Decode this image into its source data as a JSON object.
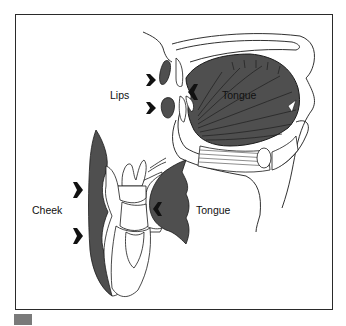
{
  "figure": {
    "labels": {
      "lips": "Lips",
      "tongue_sagittal": "Tongue",
      "cheek": "Cheek",
      "tongue_coronal": "Tongue"
    },
    "colors": {
      "muscle_fill": "#4f4f4f",
      "outline": "#1a1a1a",
      "frame": "#2a2a2a",
      "background": "#ffffff",
      "corner_tab": "#7a7a7a"
    },
    "arrows": [
      {
        "id": "lips-upper",
        "direction": "right"
      },
      {
        "id": "lips-lower",
        "direction": "right"
      },
      {
        "id": "tongue-front",
        "direction": "left"
      },
      {
        "id": "cheek-upper",
        "direction": "right"
      },
      {
        "id": "cheek-lower",
        "direction": "right"
      },
      {
        "id": "tongue-side",
        "direction": "left"
      }
    ]
  }
}
